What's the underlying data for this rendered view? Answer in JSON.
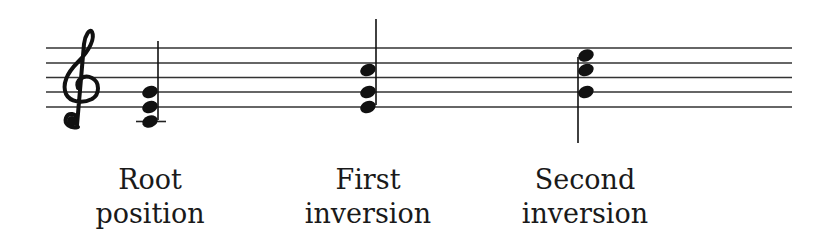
{
  "diagram": {
    "clef": "treble-clef",
    "staff": {
      "lines": 5,
      "x_start": 46,
      "x_end": 792,
      "y": [
        48,
        63,
        77,
        92,
        107
      ],
      "color": "#333333"
    },
    "chords": [
      {
        "name": "root-position",
        "label_line1": "Root",
        "label_line2": "position",
        "notes": [
          "C4",
          "E4",
          "G4"
        ],
        "stem": "up",
        "ledger_line": true
      },
      {
        "name": "first-inversion",
        "label_line1": "First",
        "label_line2": "inversion",
        "notes": [
          "E4",
          "G4",
          "C5"
        ],
        "stem": "up",
        "ledger_line": false
      },
      {
        "name": "second-inversion",
        "label_line1": "Second",
        "label_line2": "inversion",
        "notes": [
          "G4",
          "C5",
          "E5"
        ],
        "stem": "down",
        "ledger_line": false
      }
    ]
  }
}
